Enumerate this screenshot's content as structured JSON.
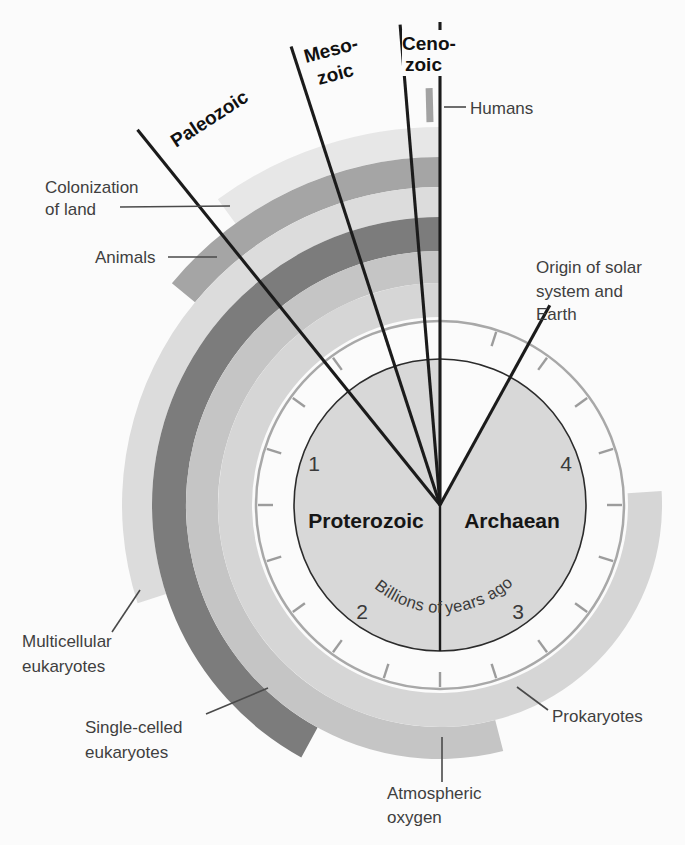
{
  "diagram": {
    "type": "geologic-time-clock",
    "eon_left": "Proterozoic",
    "eon_right": "Archaean",
    "caption_left": "Billions of",
    "caption_right": "years ago",
    "scale_numbers": [
      "1",
      "2",
      "3",
      "4"
    ],
    "full_circle_billion_years": 5,
    "tick_interval_billion_years": 0.25,
    "colors": {
      "background": "#fbfbfb",
      "inner_fill": "#d8d8d8",
      "ring": "#a8a8a8",
      "tick": "#9c9c9c",
      "line": "#1b1b1b",
      "label_text": "#3f3f3f",
      "humans_marker": "#a2a2a2"
    }
  },
  "eras": [
    {
      "id": "paleozoic",
      "lines": [
        "Paleozoic"
      ],
      "start_bya": 0.54
    },
    {
      "id": "mesozoic",
      "lines": [
        "Meso-",
        "zoic"
      ],
      "start_bya": 0.25
    },
    {
      "id": "cenozoic",
      "lines": [
        "Ceno-",
        "zoic"
      ],
      "start_bya": 0.066
    }
  ],
  "events": [
    {
      "id": "origin-of-earth",
      "lines": [
        "Origin of solar",
        "system and",
        "Earth"
      ],
      "bya": 4.6
    },
    {
      "id": "humans",
      "lines": [
        "Humans"
      ],
      "bya": 0.002
    }
  ],
  "bands": [
    {
      "id": "colonization-of-land",
      "lines": [
        "Colonization",
        "of land"
      ],
      "start_bya": 0.5,
      "color": "#e7e7e7"
    },
    {
      "id": "animals",
      "lines": [
        "Animals"
      ],
      "start_bya": 0.7,
      "color": "#a5a5a5"
    },
    {
      "id": "multicellular-eukaryotes",
      "lines": [
        "Multicellular",
        "eukaryotes"
      ],
      "start_bya": 1.5,
      "color": "#dcdcdc"
    },
    {
      "id": "single-celled-eukaryotes",
      "lines": [
        "Single-celled",
        "eukaryotes"
      ],
      "start_bya": 2.1,
      "color": "#7c7c7c"
    },
    {
      "id": "atmospheric-oxygen",
      "lines": [
        "Atmospheric",
        "oxygen"
      ],
      "start_bya": 2.7,
      "color": "#c5c5c5"
    },
    {
      "id": "prokaryotes",
      "lines": [
        "Prokaryotes"
      ],
      "start_bya": 3.8,
      "color": "#d6d6d6"
    }
  ]
}
